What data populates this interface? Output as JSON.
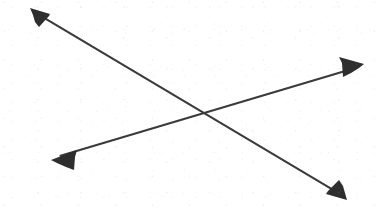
{
  "figure": {
    "background_color": "#ffffff",
    "width": 376,
    "height": 216,
    "stroke_color": "#3a3a3a",
    "stroke_width": 2,
    "intersection": {
      "x": 203,
      "y": 113,
      "label": "crossing-point"
    },
    "arrows": [
      {
        "id": "arrow-descending",
        "name": "descending-arrow",
        "direction": "top-left to bottom-right",
        "color": "#3a3a3a",
        "stroke_width": 2,
        "start": {
          "x": 31,
          "y": 10
        },
        "end": {
          "x": 345,
          "y": 197
        },
        "heads": [
          "start",
          "end"
        ],
        "head_start": {
          "name": "arrowhead-top-left",
          "points": "31,9 48,13 38,25",
          "tip": {
            "x": 31,
            "y": 9
          }
        },
        "head_end": {
          "name": "arrowhead-bottom-right",
          "points": "346,198 329,193 340,181",
          "tip": {
            "x": 346,
            "y": 198
          }
        }
      },
      {
        "id": "arrow-ascending",
        "name": "ascending-arrow",
        "direction": "bottom-left to top-right",
        "color": "#3a3a3a",
        "stroke_width": 2,
        "start": {
          "x": 53,
          "y": 158
        },
        "end": {
          "x": 362,
          "y": 66
        },
        "heads": [
          "start",
          "end"
        ],
        "head_start": {
          "name": "arrowhead-bottom-left",
          "points": "52,159 75,151 73,168",
          "tip": {
            "x": 52,
            "y": 159
          }
        },
        "head_end": {
          "name": "arrowhead-top-right",
          "points": "363,65 340,58 342,76",
          "tip": {
            "x": 363,
            "y": 65
          }
        }
      }
    ]
  }
}
